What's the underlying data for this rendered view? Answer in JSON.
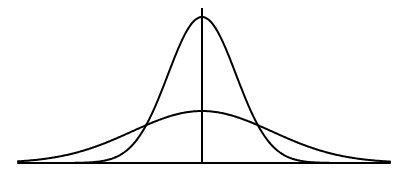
{
  "diagram": {
    "type": "normal-distribution-comparison",
    "colors": {
      "background": "#ffffff",
      "stroke": "#000000"
    },
    "axes": {
      "baseline": {
        "x1": 18,
        "x2": 390,
        "y": 163
      },
      "mean_line": {
        "x": 202,
        "y1": 8,
        "y2": 163
      }
    },
    "curves": [
      {
        "name": "narrow-tall",
        "mean_x": 202,
        "peak_y": 17,
        "sigma_px": 34
      },
      {
        "name": "wide-flat",
        "mean_x": 202,
        "peak_y": 111,
        "sigma_px": 70
      }
    ]
  }
}
